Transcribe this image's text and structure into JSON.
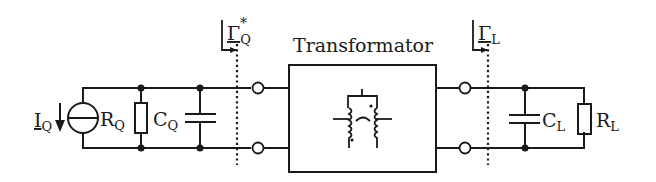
{
  "diagram": {
    "title": "Transformator",
    "source": {
      "current_label": "I",
      "current_sub": "Q",
      "resistance_label": "R",
      "resistance_sub": "Q",
      "capacitance_label": "C",
      "capacitance_sub": "Q"
    },
    "reference_planes": {
      "source_side": {
        "symbol": "Γ",
        "sub": "Q",
        "sup": "*"
      },
      "load_side": {
        "symbol": "Γ",
        "sub": "L"
      }
    },
    "load": {
      "capacitance_label": "C",
      "capacitance_sub": "L",
      "resistance_label": "R",
      "resistance_sub": "L"
    },
    "colors": {
      "line": "#1a1a1a",
      "background": "#ffffff"
    }
  }
}
